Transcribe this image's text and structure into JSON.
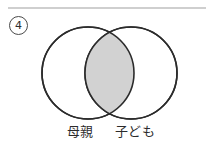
{
  "item": {
    "number": "4"
  },
  "diagram": {
    "type": "venn-two-set",
    "shaded_region": "intersection",
    "sets": [
      {
        "id": "left",
        "label": "母親",
        "cx": 88,
        "cy": 73,
        "r": 46
      },
      {
        "id": "right",
        "label": "子ども",
        "cx": 131,
        "cy": 73,
        "r": 46
      }
    ],
    "colors": {
      "stroke": "#2b2b2b",
      "circle_fill": "#ffffff",
      "intersection_fill": "#d2d2d2",
      "background": "#ffffff",
      "rule": "#cfcfcf",
      "text": "#2b2b2b"
    }
  }
}
